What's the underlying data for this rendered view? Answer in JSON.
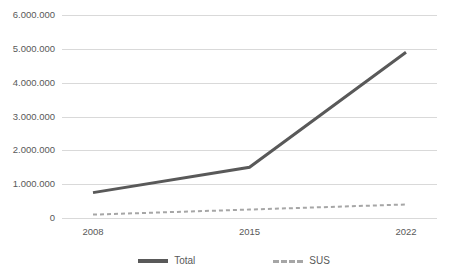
{
  "chart_data": {
    "type": "line",
    "title": "",
    "xlabel": "",
    "ylabel": "",
    "categories": [
      "2008",
      "2015",
      "2022"
    ],
    "ylim": [
      0,
      6000000
    ],
    "ytick_step": 1000000,
    "ytick_labels": [
      "6.000.000",
      "5.000.000",
      "4.000.000",
      "3.000.000",
      "2.000.000",
      "1.000.000",
      "0"
    ],
    "ytick_values": [
      6000000,
      5000000,
      4000000,
      3000000,
      2000000,
      1000000,
      0
    ],
    "grid": true,
    "legend_position": "bottom-center",
    "series": [
      {
        "name": "Total",
        "values": [
          750000,
          1500000,
          4900000
        ],
        "color": "#595959",
        "style": "solid",
        "width": 3
      },
      {
        "name": "SUS",
        "values": [
          100000,
          250000,
          400000
        ],
        "color": "#a6a6a6",
        "style": "dashed",
        "width": 2
      }
    ]
  },
  "legend": {
    "items": [
      {
        "label": "Total"
      },
      {
        "label": "SUS"
      }
    ]
  },
  "colors": {
    "total_line": "#595959",
    "sus_line": "#a6a6a6",
    "gridline": "#d9d9d9",
    "text": "#595959",
    "background": "#ffffff"
  }
}
